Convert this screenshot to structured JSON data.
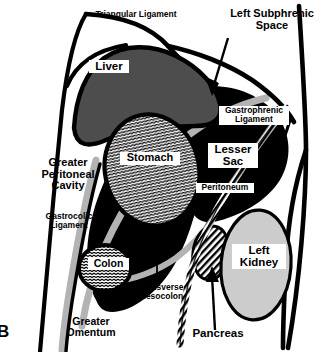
{
  "figure": {
    "panel_letter": "B",
    "caption_title": "Left Subphrenic Space and Lesser Sac Anatomy",
    "colors": {
      "outline": "#000000",
      "background": "#ffffff",
      "liver_fill": "#4d4d4d",
      "black_fill": "#000000",
      "gray_band": "#b3b3b3",
      "kidney_fill": "#cccccc",
      "label_box": "#ffffff",
      "text": "#000000"
    }
  },
  "labels": [
    {
      "id": "triangular-ligament",
      "text": "Triangular Ligament",
      "boxed": false,
      "x": 80,
      "y": 10,
      "width": 112,
      "font_size": 8.5
    },
    {
      "id": "left-subphrenic-space",
      "text": "Left Subphrenic\nSpace",
      "boxed": false,
      "x": 222,
      "y": 8,
      "width": 100,
      "font_size": 11
    },
    {
      "id": "liver",
      "text": "Liver",
      "boxed": true,
      "x": 89,
      "y": 60,
      "width": 36,
      "font_size": 11.5
    },
    {
      "id": "gastrophrenic-ligament",
      "text": "Gastrophrenic\nLigament",
      "boxed": true,
      "x": 219,
      "y": 106,
      "width": 66,
      "font_size": 8.5
    },
    {
      "id": "greater-peritoneal-cavity",
      "text": "Greater\nPeritoneal\nCavity",
      "boxed": false,
      "x": 29,
      "y": 157,
      "width": 78,
      "font_size": 11
    },
    {
      "id": "stomach",
      "text": "Stomach",
      "boxed": true,
      "x": 120,
      "y": 152,
      "width": 56,
      "font_size": 11
    },
    {
      "id": "lesser-sac",
      "text": "Lesser\nSac",
      "boxed": true,
      "x": 208,
      "y": 143,
      "width": 46,
      "font_size": 11.5
    },
    {
      "id": "peritoneum",
      "text": "Peritoneum",
      "boxed": true,
      "x": 196,
      "y": 183,
      "width": 54,
      "font_size": 8.5
    },
    {
      "id": "gastrocolic-ligament",
      "text": "Gastrocolic\nLigament",
      "boxed": false,
      "x": 38,
      "y": 212,
      "width": 62,
      "font_size": 8.5
    },
    {
      "id": "colon",
      "text": "Colon",
      "boxed": true,
      "x": 88,
      "y": 258,
      "width": 37,
      "font_size": 10.5
    },
    {
      "id": "left-kidney",
      "text": "Left\nKidney",
      "boxed": true,
      "x": 232,
      "y": 244,
      "width": 50,
      "font_size": 11.5
    },
    {
      "id": "transverse-mesocolon",
      "text": "Transverse\nMesocolon",
      "boxed": false,
      "x": 129,
      "y": 283,
      "width": 64,
      "font_size": 8.5
    },
    {
      "id": "greater-omentum",
      "text": "Greater\nOmentum",
      "boxed": false,
      "x": 60,
      "y": 316,
      "width": 62,
      "font_size": 10.5
    },
    {
      "id": "pancreas",
      "text": "Pancreas",
      "boxed": false,
      "x": 186,
      "y": 327,
      "width": 64,
      "font_size": 11.5
    }
  ],
  "structures": [
    {
      "id": "body-wall-left",
      "name": "left body wall outline"
    },
    {
      "id": "body-wall-right",
      "name": "right body wall outline"
    },
    {
      "id": "diaphragm",
      "name": "diaphragm dome"
    },
    {
      "id": "liver",
      "name": "liver (dark gray)"
    },
    {
      "id": "stomach",
      "name": "stomach (wave hatched)"
    },
    {
      "id": "colon",
      "name": "transverse colon (wave hatched)"
    },
    {
      "id": "pancreas",
      "name": "pancreas (diagonal hatched)"
    },
    {
      "id": "left-kidney",
      "name": "left kidney (light gray)"
    },
    {
      "id": "lesser-sac",
      "name": "lesser sac (black)"
    },
    {
      "id": "greater-peritoneal-cavity",
      "name": "greater peritoneal cavity (white)"
    },
    {
      "id": "peritoneum-band",
      "name": "peritoneum (gray band)"
    },
    {
      "id": "gastrophrenic-ligament",
      "name": "gastrophrenic ligament"
    },
    {
      "id": "gastrocolic-ligament",
      "name": "gastrocolic ligament"
    },
    {
      "id": "transverse-mesocolon",
      "name": "transverse mesocolon"
    },
    {
      "id": "greater-omentum",
      "name": "greater omentum"
    }
  ],
  "leader_lines": [
    {
      "id": "left-subphrenic-space-arrow",
      "from_label": "left-subphrenic-space",
      "to_structure": "left-subphrenic-space"
    },
    {
      "id": "transverse-mesocolon-leader",
      "from_label": "transverse-mesocolon",
      "to_structure": "transverse-mesocolon"
    },
    {
      "id": "pancreas-arrow",
      "from_label": "pancreas",
      "to_structure": "pancreas"
    }
  ]
}
